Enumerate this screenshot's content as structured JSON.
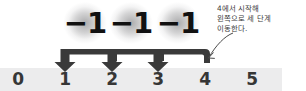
{
  "figure": {
    "type": "number-line-subtraction-diagram",
    "background_color": "#ffffff",
    "band_color": "#ececed",
    "ink_color": "#3a3a3a",
    "label_color": "#111111"
  },
  "number_line": {
    "name": "number-line",
    "min": 0,
    "max": 5,
    "tick_labels": [
      "0",
      "1",
      "2",
      "3",
      "4",
      "5"
    ],
    "tick_positions_px": [
      18,
      65,
      112,
      158,
      205,
      252
    ]
  },
  "steps": {
    "count": 3,
    "labels": [
      "−1",
      "−1",
      "−1"
    ],
    "label_positions_px": [
      85,
      131,
      178
    ],
    "arrow_targets": [
      "1",
      "2",
      "3"
    ],
    "start_value": "4",
    "end_value": "1",
    "direction": "left"
  },
  "annotation": {
    "name": "callout-text",
    "lines": [
      "4에서 시작해",
      "왼쪽으로 세 단계",
      "이동한다."
    ],
    "text": "4에서 시작해\n왼쪽으로 세 단계\n이동한다.",
    "pointer": "curved-leader-arrow-to-4"
  }
}
